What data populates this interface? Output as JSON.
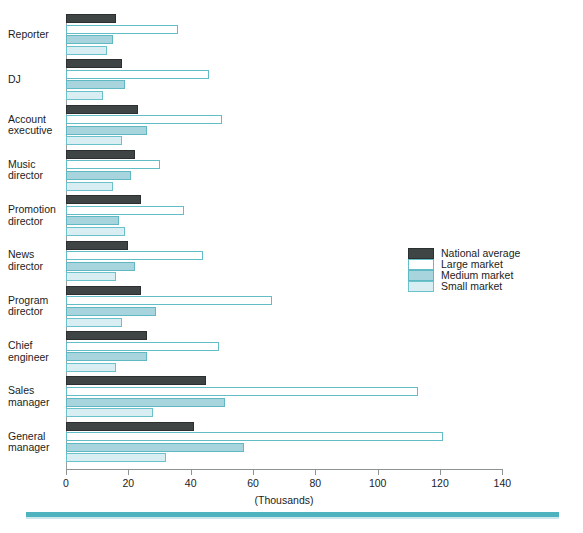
{
  "chart_data": {
    "type": "bar",
    "orientation": "horizontal",
    "title": "",
    "xlabel": "(Thousands)",
    "ylabel": "",
    "xlim": [
      0,
      140
    ],
    "xticks": [
      0,
      20,
      40,
      60,
      80,
      100,
      120,
      140
    ],
    "grid": false,
    "legend_position": "middle-right",
    "categories": [
      "Reporter",
      "DJ",
      "Account executive",
      "Music director",
      "Promotion director",
      "News director",
      "Program director",
      "Chief engineer",
      "Sales manager",
      "General manager"
    ],
    "series": [
      {
        "name": "National average",
        "color": "#3f4444",
        "values": [
          16,
          18,
          23,
          22,
          24,
          20,
          24,
          26,
          45,
          41
        ]
      },
      {
        "name": "Large market",
        "color": "#ffffff",
        "values": [
          36,
          46,
          50,
          30,
          38,
          44,
          66,
          49,
          113,
          121
        ]
      },
      {
        "name": "Medium market",
        "color": "#a8d5dd",
        "values": [
          15,
          19,
          26,
          21,
          17,
          22,
          29,
          26,
          51,
          57
        ]
      },
      {
        "name": "Small market",
        "color": "#d8eef2",
        "values": [
          13,
          12,
          18,
          15,
          19,
          16,
          18,
          16,
          28,
          32
        ]
      }
    ]
  },
  "category_labels": [
    [
      "Reporter"
    ],
    [
      "DJ"
    ],
    [
      "Account",
      "executive"
    ],
    [
      "Music",
      "director"
    ],
    [
      "Promotion",
      "director"
    ],
    [
      "News",
      "director"
    ],
    [
      "Program",
      "director"
    ],
    [
      "Chief",
      "engineer"
    ],
    [
      "Sales",
      "manager"
    ],
    [
      "General",
      "manager"
    ]
  ],
  "legend": {
    "items": [
      {
        "label": "National average",
        "key": "national"
      },
      {
        "label": "Large market",
        "key": "large"
      },
      {
        "label": "Medium market",
        "key": "medium"
      },
      {
        "label": "Small market",
        "key": "small"
      }
    ]
  },
  "axis": {
    "x_title": "(Thousands)",
    "tick_labels": [
      "0",
      "20",
      "40",
      "60",
      "80",
      "100",
      "120",
      "140"
    ]
  },
  "colors": {
    "national_average": "#3f4444",
    "large_market": "#ffffff",
    "medium_market": "#a8d5dd",
    "small_market": "#d8eef2",
    "accent_rule": "#4fb3bf",
    "axis": "#8d9393"
  },
  "footer": {
    "text": ""
  }
}
